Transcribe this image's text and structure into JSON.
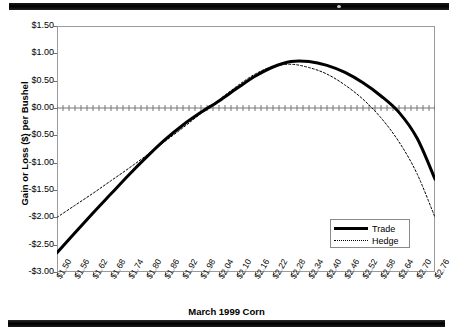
{
  "chart_data": {
    "type": "line",
    "title": "",
    "xlabel": "March 1999 Corn",
    "ylabel": "Gain or Loss ($) per Bushel",
    "grid": false,
    "legend_position": "bottom-right",
    "ylim": [
      -3.0,
      1.5
    ],
    "ytick_labels": [
      "$1.50",
      "$1.00",
      "$0.50",
      "$0.00",
      "-$0.50",
      "-$1.00",
      "-$1.50",
      "-$2.00",
      "-$2.50",
      "-$3.00"
    ],
    "ytick_values": [
      1.5,
      1.0,
      0.5,
      0.0,
      -0.5,
      -1.0,
      -1.5,
      -2.0,
      -2.5,
      -3.0
    ],
    "categories": [
      "$1.50",
      "$1.56",
      "$1.62",
      "$1.68",
      "$1.74",
      "$1.80",
      "$1.86",
      "$1.92",
      "$1.98",
      "$2.04",
      "$2.10",
      "$2.16",
      "$2.22",
      "$2.28",
      "$2.34",
      "$2.40",
      "$2.46",
      "$2.52",
      "$2.58",
      "$2.64",
      "$2.70",
      "$2.76"
    ],
    "x": [
      1.5,
      1.56,
      1.62,
      1.68,
      1.74,
      1.8,
      1.86,
      1.92,
      1.98,
      2.04,
      2.1,
      2.16,
      2.22,
      2.28,
      2.34,
      2.4,
      2.46,
      2.52,
      2.58,
      2.64,
      2.7,
      2.76
    ],
    "series": [
      {
        "name": "Trade",
        "style": "solid",
        "width": 3,
        "color": "#000000",
        "values": [
          -2.65,
          -2.28,
          -1.92,
          -1.57,
          -1.22,
          -0.89,
          -0.58,
          -0.31,
          -0.08,
          0.13,
          0.36,
          0.58,
          0.75,
          0.85,
          0.85,
          0.78,
          0.65,
          0.46,
          0.22,
          -0.08,
          -0.55,
          -1.3
        ]
      },
      {
        "name": "Hedge",
        "style": "dotted",
        "width": 1,
        "color": "#000000",
        "values": [
          -2.0,
          -1.78,
          -1.56,
          -1.33,
          -1.1,
          -0.86,
          -0.61,
          -0.36,
          -0.1,
          0.15,
          0.4,
          0.62,
          0.76,
          0.8,
          0.74,
          0.62,
          0.42,
          0.16,
          -0.18,
          -0.62,
          -1.2,
          -2.0
        ]
      }
    ],
    "zero_line": {
      "value": 0.0,
      "style": "tick-dashed"
    }
  },
  "legend": {
    "items": [
      {
        "label": "Trade"
      },
      {
        "label": "Hedge"
      }
    ]
  },
  "artifacts": {
    "top_bar": "scan-edge-bar",
    "bottom_bar": "scan-edge-bar"
  }
}
